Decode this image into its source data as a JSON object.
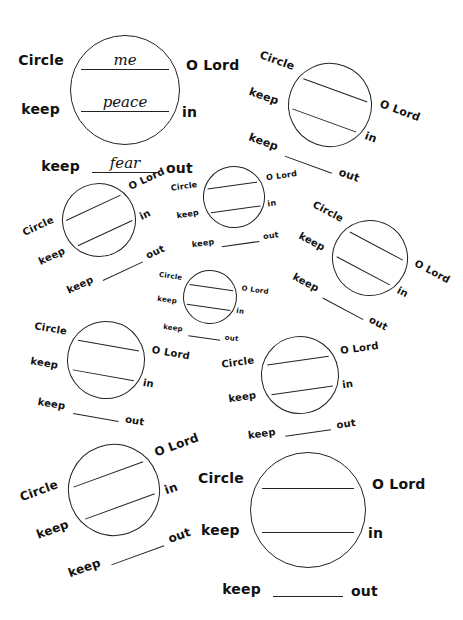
{
  "worksheet": {
    "labels": {
      "circle": "Circle",
      "lord": "O Lord",
      "keep": "keep",
      "in": "in",
      "out": "out"
    },
    "example": {
      "blank_1": "me",
      "blank_2": "peace",
      "blank_3": "fear"
    },
    "units": [
      {
        "id": 1,
        "filled": true,
        "rotation_deg": 0
      },
      {
        "id": 2,
        "filled": false,
        "rotation_deg": 20
      },
      {
        "id": 3,
        "filled": false,
        "rotation_deg": -25
      },
      {
        "id": 4,
        "filled": false,
        "rotation_deg": -8
      },
      {
        "id": 5,
        "filled": false,
        "rotation_deg": 28
      },
      {
        "id": 6,
        "filled": false,
        "rotation_deg": 8
      },
      {
        "id": 7,
        "filled": false,
        "rotation_deg": 10
      },
      {
        "id": 8,
        "filled": false,
        "rotation_deg": -8
      },
      {
        "id": 9,
        "filled": false,
        "rotation_deg": -20
      },
      {
        "id": 10,
        "filled": false,
        "rotation_deg": 0
      }
    ],
    "colors": {
      "ink": "#111111",
      "paper": "#ffffff"
    }
  }
}
